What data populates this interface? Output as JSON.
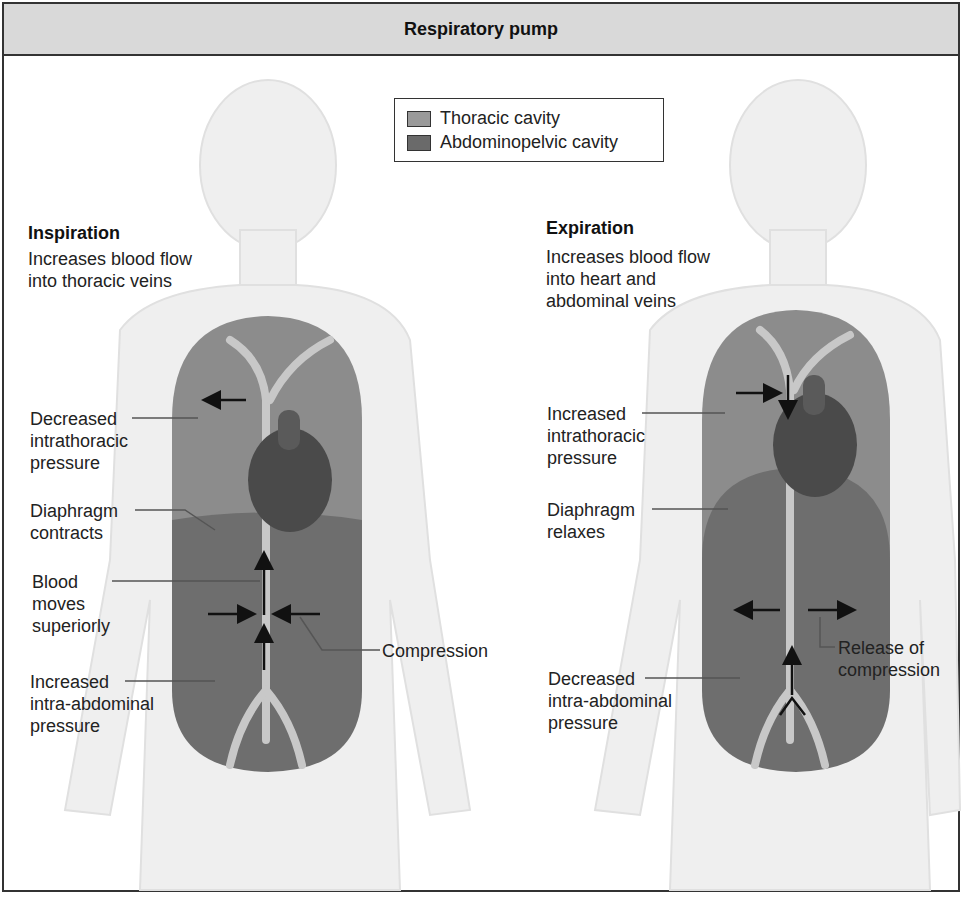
{
  "title": "Respiratory pump",
  "legend": {
    "items": [
      {
        "label": "Thoracic cavity",
        "color": "#9a9a9a"
      },
      {
        "label": "Abdominopelvic cavity",
        "color": "#6a6a6a"
      }
    ]
  },
  "inspiration": {
    "heading": "Inspiration",
    "description": "Increases blood flow into thoracic veins",
    "labels": {
      "thoracic_pressure": "Decreased\nintrathoracic\npressure",
      "diaphragm": "Diaphragm\ncontracts",
      "blood": "Blood\nmoves\nsuperiorly",
      "abdominal_pressure": "Increased\nintra-abdominal\npressure",
      "compression": "Compression"
    }
  },
  "expiration": {
    "heading": "Expiration",
    "description": "Increases blood flow into heart and abdominal veins",
    "labels": {
      "thoracic_pressure": "Increased\nintrathoracic\npressure",
      "diaphragm": "Diaphragm\nrelaxes",
      "abdominal_pressure": "Decreased\nintra-abdominal\npressure",
      "compression": "Release of\ncompression"
    }
  },
  "colors": {
    "thoracic": "#8c8c8c",
    "abdominal": "#6e6e6e",
    "body": "#eeeeee",
    "frame": "#333333"
  }
}
